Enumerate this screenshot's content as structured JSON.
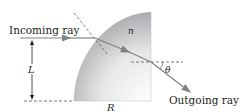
{
  "diagram": {
    "labels": {
      "incoming": "Incoming ray",
      "outgoing": "Outgoing ray",
      "index": "n",
      "length": "L",
      "radius": "R",
      "angle": "θ"
    },
    "colors": {
      "ray": "#808285",
      "dashed": "#58595b",
      "text": "#231f20",
      "shape_light": "#ffffff",
      "shape_dark": "#a7a9ac"
    }
  }
}
